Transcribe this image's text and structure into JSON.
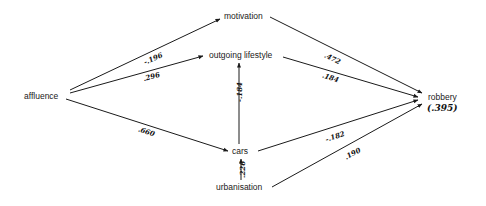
{
  "diagram": {
    "type": "path-diagram",
    "nodes": {
      "affluence": {
        "label": "affluence",
        "x": 24,
        "y": 92
      },
      "motivation": {
        "label": "motivation",
        "x": 224,
        "y": 12
      },
      "outgoing_lifestyle": {
        "label": "outgoing lifestyle",
        "x": 209,
        "y": 51
      },
      "cars": {
        "label": "cars",
        "x": 234,
        "y": 147
      },
      "urbanisation": {
        "label": "urbanisation",
        "x": 218,
        "y": 183
      },
      "robbery": {
        "label": "robbery",
        "x": 428,
        "y": 93
      }
    },
    "robbery_r2": "(.395)",
    "edges": [
      {
        "from": "affluence",
        "to": "motivation",
        "coef": "-.196"
      },
      {
        "from": "affluence",
        "to": "outgoing_lifestyle",
        "coef": ".296"
      },
      {
        "from": "affluence",
        "to": "cars",
        "coef": ".660"
      },
      {
        "from": "cars",
        "to": "outgoing_lifestyle",
        "coef": "-.184"
      },
      {
        "from": "urbanisation",
        "to": "cars",
        "coef": ".226"
      },
      {
        "from": "motivation",
        "to": "robbery",
        "coef": ".472"
      },
      {
        "from": "outgoing_lifestyle",
        "to": "robbery",
        "coef": ".184"
      },
      {
        "from": "cars",
        "to": "robbery",
        "coef": "-.182"
      },
      {
        "from": "urbanisation",
        "to": "robbery",
        "coef": ".190"
      }
    ]
  }
}
